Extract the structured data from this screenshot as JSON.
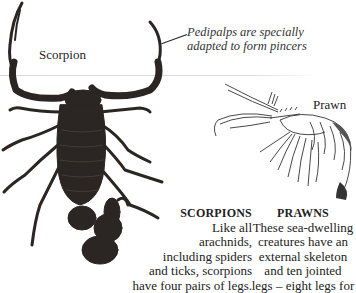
{
  "page": {
    "labels": {
      "scorpion": "Scorpion",
      "prawn": "Prawn"
    },
    "annotation": {
      "pedipalps_line1": "Pedipalps are specially",
      "pedipalps_line2": "adapted to form pincers"
    },
    "captions": {
      "scorpions": {
        "title": "SCORPIONS",
        "lines": [
          "Like all",
          "arachnids,",
          "including spiders",
          "and ticks, scorpions",
          "have four pairs of legs."
        ]
      },
      "prawns": {
        "title": "PRAWNS",
        "lines": [
          "These sea-dwelling",
          "creatures have an",
          "external skeleton",
          "and ten jointed",
          "legs – eight legs for"
        ]
      }
    },
    "illustrations": {
      "scorpion": "scorpion-photo",
      "prawn": "prawn-engraving"
    },
    "colors": {
      "scorpion_body": "#2b2623",
      "scorpion_highlight": "#4a403a",
      "prawn_ink": "#333333",
      "rule": "#dcdcdc"
    }
  }
}
